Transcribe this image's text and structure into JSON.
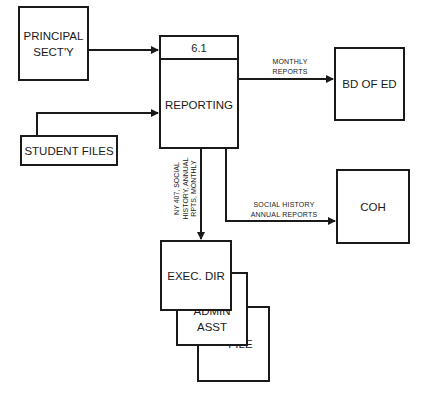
{
  "diagram": {
    "type": "data-flow-diagram",
    "process": {
      "id": "6.1",
      "label": "REPORTING"
    },
    "entities": {
      "principal": {
        "line1": "PRINCIPAL",
        "line2": "SECT'Y"
      },
      "student_files": {
        "label": "STUDENT FILES"
      },
      "bd_of_ed": {
        "label": "BD OF ED"
      },
      "coh": {
        "label": "COH"
      },
      "exec_dir": {
        "label": "EXEC. DIR"
      },
      "admin_asst": {
        "line1": "ADMIN",
        "line2": "ASST"
      },
      "file": {
        "label": "FILE"
      }
    },
    "flows": {
      "monthly_reports": {
        "line1": "MONTHLY",
        "line2": "REPORTS"
      },
      "social_history": {
        "line1": "SOCIAL HISTORY",
        "line2": "ANNUAL REPORTS"
      },
      "ny407": {
        "line1": "NY 407, SOCIAL",
        "line2": "HISTORY, ANNUAL",
        "line3": "RPTS, MONTHLY"
      }
    },
    "colors": {
      "line": "#1a1a1a",
      "background": "#ffffff"
    }
  }
}
